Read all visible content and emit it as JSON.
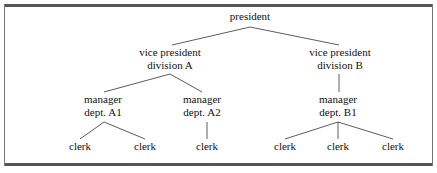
{
  "chart_data": {
    "type": "diagram",
    "subtype": "organization-tree",
    "title": "",
    "orientation": "top-down",
    "levels": 4,
    "node_count": 12,
    "edge_count": 11,
    "colors": {
      "background": "#ffffff",
      "text": "#111111",
      "connector": "#4a4a4a",
      "frame_rule": "#555555",
      "frame_side": "#777777"
    },
    "nodes": [
      {
        "id": "president",
        "lines": [
          "president"
        ],
        "level": 0,
        "x": 250,
        "y": 10
      },
      {
        "id": "vp-a",
        "lines": [
          "vice president",
          "division A"
        ],
        "level": 1,
        "x": 170,
        "y": 46
      },
      {
        "id": "vp-b",
        "lines": [
          "vice president",
          "division B"
        ],
        "level": 1,
        "x": 340,
        "y": 46
      },
      {
        "id": "mgr-a1",
        "lines": [
          "manager",
          "dept. A1"
        ],
        "level": 2,
        "x": 103,
        "y": 93
      },
      {
        "id": "mgr-a2",
        "lines": [
          "manager",
          "dept. A2"
        ],
        "level": 2,
        "x": 202,
        "y": 93
      },
      {
        "id": "mgr-b1",
        "lines": [
          "manager",
          "dept. B1"
        ],
        "level": 2,
        "x": 338,
        "y": 93
      },
      {
        "id": "clerk-1",
        "lines": [
          "clerk"
        ],
        "level": 3,
        "x": 80,
        "y": 140
      },
      {
        "id": "clerk-2",
        "lines": [
          "clerk"
        ],
        "level": 3,
        "x": 145,
        "y": 140
      },
      {
        "id": "clerk-3",
        "lines": [
          "clerk"
        ],
        "level": 3,
        "x": 207,
        "y": 140
      },
      {
        "id": "clerk-4",
        "lines": [
          "clerk"
        ],
        "level": 3,
        "x": 285,
        "y": 140
      },
      {
        "id": "clerk-5",
        "lines": [
          "clerk"
        ],
        "level": 3,
        "x": 338,
        "y": 140
      },
      {
        "id": "clerk-6",
        "lines": [
          "clerk"
        ],
        "level": 3,
        "x": 393,
        "y": 140
      }
    ],
    "edges": [
      {
        "from": "president",
        "to": "vp-a",
        "x1": 250,
        "y1": 27,
        "x2": 172,
        "y2": 45
      },
      {
        "from": "president",
        "to": "vp-b",
        "x1": 250,
        "y1": 27,
        "x2": 339,
        "y2": 45
      },
      {
        "from": "vp-a",
        "to": "mgr-a1",
        "x1": 170,
        "y1": 74,
        "x2": 104,
        "y2": 92
      },
      {
        "from": "vp-a",
        "to": "mgr-a2",
        "x1": 170,
        "y1": 74,
        "x2": 202,
        "y2": 92
      },
      {
        "from": "vp-b",
        "to": "mgr-b1",
        "x1": 339,
        "y1": 74,
        "x2": 339,
        "y2": 92
      },
      {
        "from": "mgr-a1",
        "to": "clerk-1",
        "x1": 104,
        "y1": 122,
        "x2": 80,
        "y2": 139
      },
      {
        "from": "mgr-a1",
        "to": "clerk-2",
        "x1": 104,
        "y1": 122,
        "x2": 145,
        "y2": 139
      },
      {
        "from": "mgr-a2",
        "to": "clerk-3",
        "x1": 207,
        "y1": 122,
        "x2": 207,
        "y2": 139
      },
      {
        "from": "mgr-b1",
        "to": "clerk-4",
        "x1": 338,
        "y1": 122,
        "x2": 285,
        "y2": 139
      },
      {
        "from": "mgr-b1",
        "to": "clerk-5",
        "x1": 338,
        "y1": 122,
        "x2": 338,
        "y2": 139
      },
      {
        "from": "mgr-b1",
        "to": "clerk-6",
        "x1": 338,
        "y1": 122,
        "x2": 393,
        "y2": 139
      }
    ]
  }
}
